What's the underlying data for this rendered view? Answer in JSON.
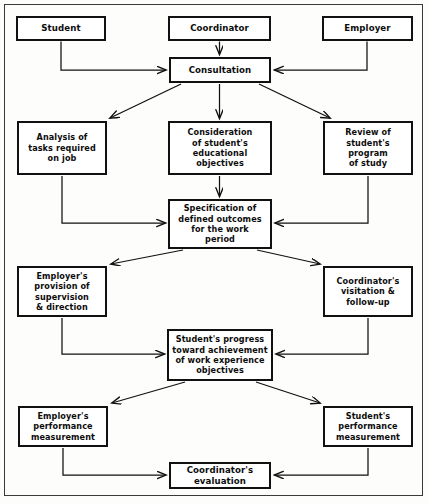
{
  "figure": {
    "type": "flowchart",
    "orientation": "top-to-bottom",
    "title": "",
    "background_color": "#fdfdfb",
    "line_color": "#111111",
    "text_color": "#0c0c0c"
  },
  "nodes": [
    {
      "id": "student",
      "label": "Student",
      "x": 16,
      "y": 16,
      "w": 90,
      "h": 25
    },
    {
      "id": "coordinator",
      "label": "Coordinator",
      "x": 168,
      "y": 16,
      "w": 103,
      "h": 25
    },
    {
      "id": "employer",
      "label": "Employer",
      "x": 322,
      "y": 16,
      "w": 91,
      "h": 25
    },
    {
      "id": "consultation",
      "label": "Consultation",
      "x": 169,
      "y": 57,
      "w": 102,
      "h": 26
    },
    {
      "id": "analysis",
      "label": "Analysis of\ntasks required\non job",
      "x": 17,
      "y": 121,
      "w": 90,
      "h": 54
    },
    {
      "id": "consideration",
      "label": "Consideration\nof student's\neducational\nobjectives",
      "x": 168,
      "y": 121,
      "w": 104,
      "h": 54
    },
    {
      "id": "review",
      "label": "Review of\nstudent's program\nof study",
      "x": 323,
      "y": 121,
      "w": 90,
      "h": 54
    },
    {
      "id": "specification",
      "label": "Specification of\ndefined outcomes\nfor the work\nperiod",
      "x": 168,
      "y": 199,
      "w": 104,
      "h": 50
    },
    {
      "id": "employer_prov",
      "label": "Employer's\nprovision of\nsupervision\n& direction",
      "x": 17,
      "y": 266,
      "w": 90,
      "h": 51
    },
    {
      "id": "coord_visit",
      "label": "Coordinator's\nvisitation &\nfollow-up",
      "x": 323,
      "y": 266,
      "w": 90,
      "h": 51
    },
    {
      "id": "progress",
      "label": "Student's progress\ntoward achievement\nof work experience\nobjectives",
      "x": 167,
      "y": 329,
      "w": 106,
      "h": 52
    },
    {
      "id": "employer_perf",
      "label": "Employer's\nperformance\nmeasurement",
      "x": 18,
      "y": 406,
      "w": 90,
      "h": 41
    },
    {
      "id": "student_perf",
      "label": "Student's\nperformance\nmeasurement",
      "x": 323,
      "y": 406,
      "w": 90,
      "h": 41
    },
    {
      "id": "evaluation",
      "label": "Coordinator's\nevaluation",
      "x": 169,
      "y": 462,
      "w": 102,
      "h": 27
    }
  ],
  "edges": [
    {
      "id": "e1",
      "from": "student",
      "to": "consultation",
      "style": "elbow-right",
      "arrow": true
    },
    {
      "id": "e2",
      "from": "coordinator",
      "to": "consultation",
      "style": "straight-down",
      "arrow": true
    },
    {
      "id": "e3",
      "from": "employer",
      "to": "consultation",
      "style": "elbow-left",
      "arrow": true
    },
    {
      "id": "e4",
      "from": "consultation",
      "to": "analysis",
      "style": "diagonal-left",
      "arrow": true
    },
    {
      "id": "e5",
      "from": "consultation",
      "to": "consideration",
      "style": "straight-down",
      "arrow": true
    },
    {
      "id": "e6",
      "from": "consultation",
      "to": "review",
      "style": "diagonal-right",
      "arrow": true
    },
    {
      "id": "e7",
      "from": "analysis",
      "to": "specification",
      "style": "elbow-right",
      "arrow": true
    },
    {
      "id": "e8",
      "from": "consideration",
      "to": "specification",
      "style": "straight-down",
      "arrow": true
    },
    {
      "id": "e9",
      "from": "review",
      "to": "specification",
      "style": "elbow-left",
      "arrow": true
    },
    {
      "id": "e10",
      "from": "specification",
      "to": "employer_prov",
      "style": "diagonal-left",
      "arrow": true
    },
    {
      "id": "e11",
      "from": "specification",
      "to": "coord_visit",
      "style": "diagonal-right",
      "arrow": true
    },
    {
      "id": "e12",
      "from": "employer_prov",
      "to": "progress",
      "style": "elbow-right",
      "arrow": true
    },
    {
      "id": "e13",
      "from": "coord_visit",
      "to": "progress",
      "style": "elbow-left",
      "arrow": true
    },
    {
      "id": "e14",
      "from": "progress",
      "to": "employer_perf",
      "style": "diagonal-left",
      "arrow": true
    },
    {
      "id": "e15",
      "from": "progress",
      "to": "student_perf",
      "style": "diagonal-right",
      "arrow": true
    },
    {
      "id": "e16",
      "from": "employer_perf",
      "to": "evaluation",
      "style": "elbow-right",
      "arrow": true
    },
    {
      "id": "e17",
      "from": "student_perf",
      "to": "evaluation",
      "style": "elbow-left",
      "arrow": true
    }
  ]
}
